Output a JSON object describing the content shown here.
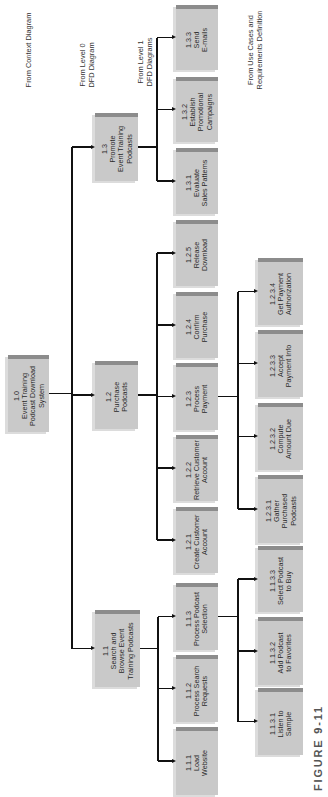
{
  "notes": [
    {
      "id": "context",
      "text": "From Context Diagram",
      "cx": 29,
      "cy": 50
    },
    {
      "id": "level0",
      "text": "From Level 0\nDFD Diagram",
      "cx": 88,
      "cy": 65
    },
    {
      "id": "level1",
      "text": "From Level 1\nDFD Diagrams",
      "cx": 146,
      "cy": 62
    },
    {
      "id": "usecases",
      "text": "From Use Cases and\nRequirements Definition",
      "cx": 256,
      "cy": 50
    }
  ],
  "nodes": [
    {
      "id": "1.0",
      "label": "1.0\nEvent Training\nPodcast Download\nSystem",
      "x": 8,
      "y": 355,
      "w": 41,
      "h": 77
    },
    {
      "id": "1.3",
      "label": "1.3\nPromote\nEvent Training\nPodcasts",
      "x": 95,
      "y": 113,
      "w": 43,
      "h": 68
    },
    {
      "id": "1.2",
      "label": "1.2\nPurchase\nPodcasts",
      "x": 95,
      "y": 361,
      "w": 43,
      "h": 68
    },
    {
      "id": "1.1",
      "label": "1.1\nSearch and\nBrowse Event\nTraining Podcasts",
      "x": 95,
      "y": 610,
      "w": 45,
      "h": 77
    },
    {
      "id": "1.3.3",
      "label": "1.3.3\nSend\nE-mails",
      "x": 176,
      "y": 5,
      "w": 42,
      "h": 65
    },
    {
      "id": "1.3.2",
      "label": "1.3.2\nEstablish\nPromotional\nCampaigns",
      "x": 176,
      "y": 77,
      "w": 42,
      "h": 65
    },
    {
      "id": "1.3.1",
      "label": "1.3.1\nEvaluate\nSales Patterns",
      "x": 176,
      "y": 148,
      "w": 42,
      "h": 66
    },
    {
      "id": "1.2.5",
      "label": "1.2.5\nRelease\nDownload",
      "x": 176,
      "y": 220,
      "w": 42,
      "h": 66
    },
    {
      "id": "1.2.4",
      "label": "1.2.4\nConfirm\nPurchase",
      "x": 176,
      "y": 292,
      "w": 42,
      "h": 66
    },
    {
      "id": "1.2.3",
      "label": "1.2.3\nProcess\nPayment",
      "x": 176,
      "y": 363,
      "w": 42,
      "h": 67
    },
    {
      "id": "1.2.2",
      "label": "1.2.2\nRetrieve Customer\nAccount",
      "x": 176,
      "y": 435,
      "w": 42,
      "h": 66
    },
    {
      "id": "1.2.1",
      "label": "1.2.1\nCreate Customer\nAccount",
      "x": 176,
      "y": 507,
      "w": 42,
      "h": 66
    },
    {
      "id": "1.1.3",
      "label": "1.1.3\nProcess Podcast\nSelection",
      "x": 176,
      "y": 583,
      "w": 42,
      "h": 67
    },
    {
      "id": "1.1.2",
      "label": "1.1.2\nProcess Search\nRequests",
      "x": 176,
      "y": 655,
      "w": 42,
      "h": 67
    },
    {
      "id": "1.1.1",
      "label": "1.1.1\nLoad\nWebsite",
      "x": 176,
      "y": 727,
      "w": 42,
      "h": 68
    },
    {
      "id": "1.2.3.4",
      "label": "1.2.3.4\nGet Payment\nAuthorization",
      "x": 258,
      "y": 258,
      "w": 45,
      "h": 67
    },
    {
      "id": "1.2.3.3",
      "label": "1.2.3.3\nAccept\nPayment Info",
      "x": 258,
      "y": 330,
      "w": 45,
      "h": 67
    },
    {
      "id": "1.2.3.2",
      "label": "1.2.3.2\nCompute\nAmount Due",
      "x": 258,
      "y": 403,
      "w": 45,
      "h": 67
    },
    {
      "id": "1.2.3.1",
      "label": "1.2.3.1\nGather\nPurchased\nPodcasts",
      "x": 258,
      "y": 475,
      "w": 45,
      "h": 68
    },
    {
      "id": "1.1.3.3",
      "label": "1.1.3.3\nSelect Podcast\nto Buy",
      "x": 258,
      "y": 546,
      "w": 45,
      "h": 66
    },
    {
      "id": "1.1.3.2",
      "label": "1.1.3.2\nAdd Podcast\nto Favorites",
      "x": 258,
      "y": 617,
      "w": 45,
      "h": 68
    },
    {
      "id": "1.1.3.1",
      "label": "1.1.3.1\nListen to\nSample",
      "x": 258,
      "y": 688,
      "w": 45,
      "h": 67
    }
  ],
  "edges": [
    {
      "from": "1.0",
      "to": [
        "1.3",
        "1.2",
        "1.1"
      ]
    },
    {
      "from": "1.3",
      "to": [
        "1.3.3",
        "1.3.2",
        "1.3.1"
      ]
    },
    {
      "from": "1.2",
      "to": [
        "1.2.5",
        "1.2.4",
        "1.2.3",
        "1.2.2",
        "1.2.1"
      ]
    },
    {
      "from": "1.1",
      "to": [
        "1.1.3",
        "1.1.2",
        "1.1.1"
      ]
    },
    {
      "from": "1.2.3",
      "to": [
        "1.2.3.4",
        "1.2.3.3",
        "1.2.3.2",
        "1.2.3.1"
      ]
    },
    {
      "from": "1.1.3",
      "to": [
        "1.1.3.3",
        "1.1.3.2",
        "1.1.3.1"
      ]
    }
  ],
  "figure_label": "FIGURE 9-11"
}
